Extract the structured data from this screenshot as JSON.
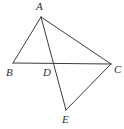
{
  "figure": {
    "background_color": "#ffffff",
    "stroke_color": "#3c3c40",
    "label_color": "#2e2e32",
    "width": 124,
    "height": 129,
    "points": {
      "A": {
        "label": "A",
        "x": 41,
        "y": 17
      },
      "B": {
        "label": "B",
        "x": 13,
        "y": 63
      },
      "C": {
        "label": "C",
        "x": 111,
        "y": 64
      },
      "D": {
        "label": "D",
        "x": 50,
        "y": 64
      },
      "E": {
        "label": "E",
        "x": 66,
        "y": 110
      }
    },
    "segments": [
      {
        "name": "AB",
        "from": "A",
        "to": "B"
      },
      {
        "name": "AC",
        "from": "A",
        "to": "C"
      },
      {
        "name": "BC",
        "from": "B",
        "to": "C"
      },
      {
        "name": "AE",
        "from": "A",
        "to": "E"
      },
      {
        "name": "CE",
        "from": "C",
        "to": "E"
      }
    ]
  }
}
